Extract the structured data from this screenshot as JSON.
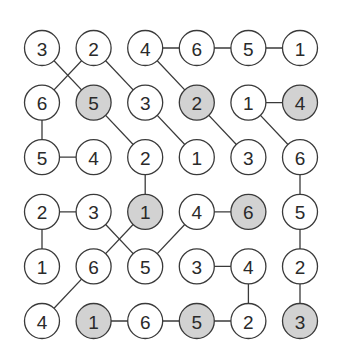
{
  "puzzle": {
    "rows": 6,
    "cols": 6,
    "colors": {
      "background": "#ffffff",
      "circle_fill": "#ffffff",
      "shaded_fill": "#d2d2d2",
      "stroke": "#3a3a3a",
      "text": "#2a2a2a"
    },
    "cells": [
      [
        {
          "v": "3",
          "s": false
        },
        {
          "v": "2",
          "s": false
        },
        {
          "v": "4",
          "s": false
        },
        {
          "v": "6",
          "s": false
        },
        {
          "v": "5",
          "s": false
        },
        {
          "v": "1",
          "s": false
        }
      ],
      [
        {
          "v": "6",
          "s": false
        },
        {
          "v": "5",
          "s": true
        },
        {
          "v": "3",
          "s": false
        },
        {
          "v": "2",
          "s": true
        },
        {
          "v": "1",
          "s": false
        },
        {
          "v": "4",
          "s": true
        }
      ],
      [
        {
          "v": "5",
          "s": false
        },
        {
          "v": "4",
          "s": false
        },
        {
          "v": "2",
          "s": false
        },
        {
          "v": "1",
          "s": false
        },
        {
          "v": "3",
          "s": false
        },
        {
          "v": "6",
          "s": false
        }
      ],
      [
        {
          "v": "2",
          "s": false
        },
        {
          "v": "3",
          "s": false
        },
        {
          "v": "1",
          "s": true
        },
        {
          "v": "4",
          "s": false
        },
        {
          "v": "6",
          "s": true
        },
        {
          "v": "5",
          "s": false
        }
      ],
      [
        {
          "v": "1",
          "s": false
        },
        {
          "v": "6",
          "s": false
        },
        {
          "v": "5",
          "s": false
        },
        {
          "v": "3",
          "s": false
        },
        {
          "v": "4",
          "s": false
        },
        {
          "v": "2",
          "s": false
        }
      ],
      [
        {
          "v": "4",
          "s": false
        },
        {
          "v": "1",
          "s": true
        },
        {
          "v": "6",
          "s": false
        },
        {
          "v": "5",
          "s": true
        },
        {
          "v": "2",
          "s": false
        },
        {
          "v": "3",
          "s": true
        }
      ]
    ],
    "edges": [
      [
        [
          0,
          0
        ],
        [
          1,
          1
        ]
      ],
      [
        [
          0,
          1
        ],
        [
          1,
          0
        ]
      ],
      [
        [
          0,
          1
        ],
        [
          1,
          2
        ]
      ],
      [
        [
          0,
          2
        ],
        [
          0,
          3
        ]
      ],
      [
        [
          0,
          3
        ],
        [
          0,
          4
        ]
      ],
      [
        [
          0,
          4
        ],
        [
          0,
          5
        ]
      ],
      [
        [
          0,
          2
        ],
        [
          1,
          3
        ]
      ],
      [
        [
          1,
          0
        ],
        [
          2,
          0
        ]
      ],
      [
        [
          1,
          1
        ],
        [
          2,
          2
        ]
      ],
      [
        [
          1,
          2
        ],
        [
          2,
          3
        ]
      ],
      [
        [
          1,
          3
        ],
        [
          2,
          4
        ]
      ],
      [
        [
          1,
          4
        ],
        [
          1,
          5
        ]
      ],
      [
        [
          1,
          4
        ],
        [
          2,
          5
        ]
      ],
      [
        [
          2,
          0
        ],
        [
          2,
          1
        ]
      ],
      [
        [
          2,
          2
        ],
        [
          3,
          2
        ]
      ],
      [
        [
          2,
          5
        ],
        [
          3,
          5
        ]
      ],
      [
        [
          3,
          0
        ],
        [
          3,
          1
        ]
      ],
      [
        [
          3,
          0
        ],
        [
          4,
          0
        ]
      ],
      [
        [
          3,
          1
        ],
        [
          4,
          2
        ]
      ],
      [
        [
          3,
          2
        ],
        [
          4,
          1
        ]
      ],
      [
        [
          3,
          3
        ],
        [
          3,
          4
        ]
      ],
      [
        [
          3,
          3
        ],
        [
          4,
          2
        ]
      ],
      [
        [
          3,
          5
        ],
        [
          4,
          5
        ]
      ],
      [
        [
          4,
          1
        ],
        [
          5,
          0
        ]
      ],
      [
        [
          4,
          3
        ],
        [
          4,
          4
        ]
      ],
      [
        [
          4,
          4
        ],
        [
          5,
          4
        ]
      ],
      [
        [
          4,
          5
        ],
        [
          5,
          5
        ]
      ],
      [
        [
          5,
          1
        ],
        [
          5,
          2
        ]
      ],
      [
        [
          5,
          2
        ],
        [
          5,
          3
        ]
      ],
      [
        [
          5,
          3
        ],
        [
          5,
          4
        ]
      ]
    ]
  }
}
